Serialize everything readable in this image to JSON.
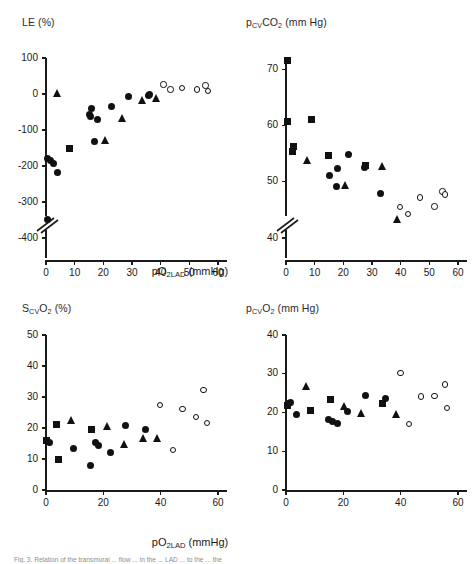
{
  "figure": {
    "width": 476,
    "height": 564,
    "background": "#ffffff",
    "marker_color": "#111111",
    "axis_color": "#1a1a1a",
    "caption_cut_off": "Fig. 3. Relation of the transmural ... flow ... in the ... LAD ... to the ... the"
  },
  "shared": {
    "xlabel_main": "pO",
    "xlabel_sub": "2LAD",
    "xlabel_unit": "(mmHg)",
    "xlabel_full": "pO2LAD (mmHg)"
  },
  "chart_data": [
    {
      "id": "panel-le",
      "type": "scatter",
      "title": "",
      "ylabel": "LE (%)",
      "ylabel_parts": {
        "main": "LE",
        "sub": "",
        "unit": "(%)"
      },
      "xlabel": "pO2LAD (mmHg)",
      "xlim": [
        0,
        60
      ],
      "ylim": [
        -400,
        100
      ],
      "xticks": [
        0,
        10,
        20,
        30,
        40,
        50,
        60
      ],
      "yticks": [
        -400,
        -300,
        -200,
        -100,
        0,
        100
      ],
      "ytick_labels": [
        "-400",
        "-300",
        "-200",
        "-100",
        "0",
        "100"
      ],
      "xtick_labels": [
        "0",
        "10",
        "20",
        "30",
        "40",
        "50",
        "60"
      ],
      "grid": false,
      "legend": "none",
      "y_axis_break": true,
      "series": [
        {
          "name": "filled-circle",
          "marker": "circle-filled",
          "points": [
            [
              0.4,
              -180
            ],
            [
              1.6,
              -185
            ],
            [
              2.6,
              -192
            ],
            [
              4.0,
              -218
            ],
            [
              0.5,
              -348
            ],
            [
              15.2,
              -58
            ],
            [
              15.6,
              -62
            ],
            [
              16.0,
              -40
            ],
            [
              17.8,
              -70
            ],
            [
              17.0,
              -132
            ],
            [
              22.8,
              -36
            ],
            [
              28.8,
              -8
            ],
            [
              35.6,
              -3
            ],
            [
              36.2,
              0
            ]
          ]
        },
        {
          "name": "filled-square",
          "marker": "square-filled",
          "points": [
            [
              8.2,
              -152
            ]
          ]
        },
        {
          "name": "filled-triangle",
          "marker": "triangle-filled",
          "points": [
            [
              4.2,
              0
            ],
            [
              20.8,
              -130
            ],
            [
              26.6,
              -68
            ],
            [
              33.6,
              -18
            ],
            [
              38.6,
              -12
            ]
          ]
        },
        {
          "name": "open-circle",
          "marker": "circle-open",
          "points": [
            [
              41.0,
              26
            ],
            [
              43.4,
              12
            ],
            [
              47.4,
              17
            ],
            [
              52.6,
              13
            ],
            [
              55.6,
              24
            ],
            [
              56.6,
              8
            ]
          ]
        }
      ]
    },
    {
      "id": "panel-pcvco2",
      "type": "scatter",
      "title": "",
      "ylabel": "pCVCO2 (mm Hg)",
      "ylabel_parts": {
        "main": "p",
        "sub": "CV",
        "main2": "CO",
        "sub2": "2",
        "unit": "(mm Hg)"
      },
      "xlabel": "pO2LAD (mmHg)",
      "xlim": [
        0,
        60
      ],
      "ylim": [
        40,
        72
      ],
      "xticks": [
        0,
        10,
        20,
        30,
        40,
        50,
        60
      ],
      "yticks": [
        40,
        50,
        60,
        70
      ],
      "ytick_labels": [
        "40",
        "50",
        "60",
        "70"
      ],
      "xtick_labels": [
        "0",
        "10",
        "20",
        "30",
        "40",
        "50",
        "60"
      ],
      "grid": false,
      "legend": "none",
      "y_axis_break": true,
      "series": [
        {
          "name": "filled-square",
          "marker": "square-filled",
          "points": [
            [
              0.5,
              71.6
            ],
            [
              0.6,
              60.7
            ],
            [
              8.8,
              61.0
            ],
            [
              2.6,
              56.2
            ],
            [
              2.2,
              55.4
            ],
            [
              14.8,
              54.6
            ],
            [
              27.6,
              52.9
            ]
          ]
        },
        {
          "name": "filled-circle",
          "marker": "circle-filled",
          "points": [
            [
              15.2,
              51.2
            ],
            [
              17.8,
              52.3
            ],
            [
              17.6,
              49.2
            ],
            [
              21.8,
              54.8
            ],
            [
              27.4,
              52.6
            ],
            [
              33.0,
              48.0
            ]
          ]
        },
        {
          "name": "filled-triangle",
          "marker": "triangle-filled",
          "points": [
            [
              7.6,
              53.8
            ],
            [
              20.8,
              49.3
            ],
            [
              33.6,
              52.7
            ],
            [
              38.8,
              43.2
            ]
          ]
        },
        {
          "name": "open-circle",
          "marker": "circle-open",
          "points": [
            [
              39.8,
              45.5
            ],
            [
              42.6,
              44.3
            ],
            [
              46.8,
              47.2
            ],
            [
              51.8,
              45.6
            ],
            [
              54.6,
              48.3
            ],
            [
              55.4,
              47.7
            ]
          ]
        }
      ]
    },
    {
      "id": "panel-scvo2",
      "type": "scatter",
      "title": "",
      "ylabel": "SCVO2 (%)",
      "ylabel_parts": {
        "main": "S",
        "sub": "CV",
        "main2": "O",
        "sub2": "2",
        "unit": "(%)"
      },
      "xlabel": "pO2LAD (mmHg)",
      "xlim": [
        0,
        60
      ],
      "ylim": [
        0,
        50
      ],
      "xticks": [
        0,
        20,
        40,
        60
      ],
      "yticks": [
        0,
        10,
        20,
        30,
        40,
        50
      ],
      "ytick_labels": [
        "0",
        "10",
        "20",
        "30",
        "40",
        "50"
      ],
      "xtick_labels": [
        "0",
        "20",
        "40",
        "60"
      ],
      "grid": false,
      "legend": "none",
      "y_axis_break": false,
      "series": [
        {
          "name": "filled-square",
          "marker": "square-filled",
          "points": [
            [
              0.3,
              15.9
            ],
            [
              3.6,
              21.1
            ],
            [
              4.2,
              9.7
            ],
            [
              16.0,
              19.6
            ]
          ]
        },
        {
          "name": "filled-circle",
          "marker": "circle-filled",
          "points": [
            [
              1.2,
              15.3
            ],
            [
              9.6,
              13.5
            ],
            [
              15.6,
              7.9
            ],
            [
              17.4,
              15.4
            ],
            [
              18.2,
              14.4
            ],
            [
              22.6,
              12.1
            ],
            [
              27.6,
              20.9
            ],
            [
              34.6,
              19.6
            ]
          ]
        },
        {
          "name": "filled-triangle",
          "marker": "triangle-filled",
          "points": [
            [
              9.0,
              22.4
            ],
            [
              21.4,
              20.5
            ],
            [
              27.4,
              14.7
            ],
            [
              34.0,
              16.7
            ],
            [
              39.0,
              16.6
            ]
          ]
        },
        {
          "name": "open-circle",
          "marker": "circle-open",
          "points": [
            [
              39.8,
              27.4
            ],
            [
              44.4,
              12.9
            ],
            [
              47.6,
              26.2
            ],
            [
              52.4,
              23.5
            ],
            [
              55.0,
              32.3
            ],
            [
              56.2,
              21.7
            ]
          ]
        }
      ]
    },
    {
      "id": "panel-pcvo2",
      "type": "scatter",
      "title": "",
      "ylabel": "pCVO2 (mm Hg)",
      "ylabel_parts": {
        "main": "p",
        "sub": "CV",
        "main2": "O",
        "sub2": "2",
        "unit": "(mm Hg)"
      },
      "xlabel": "pO2LAD (mmHg)",
      "xlim": [
        0,
        60
      ],
      "ylim": [
        0,
        40
      ],
      "xticks": [
        0,
        20,
        40,
        60
      ],
      "yticks": [
        0,
        10,
        20,
        30,
        40
      ],
      "ytick_labels": [
        "0",
        "10",
        "20",
        "30",
        "40"
      ],
      "xtick_labels": [
        "0",
        "20",
        "40",
        "60"
      ],
      "grid": false,
      "legend": "none",
      "y_axis_break": false,
      "series": [
        {
          "name": "filled-square",
          "marker": "square-filled",
          "points": [
            [
              0.4,
              21.8
            ],
            [
              8.6,
              20.6
            ],
            [
              15.6,
              23.3
            ],
            [
              33.6,
              22.3
            ]
          ]
        },
        {
          "name": "filled-circle",
          "marker": "circle-filled",
          "points": [
            [
              1.0,
              22.4
            ],
            [
              1.4,
              22.6
            ],
            [
              3.6,
              19.5
            ],
            [
              14.8,
              18.1
            ],
            [
              16.2,
              17.8
            ],
            [
              18.0,
              17.1
            ],
            [
              21.4,
              20.2
            ],
            [
              27.6,
              24.4
            ],
            [
              34.6,
              23.5
            ]
          ]
        },
        {
          "name": "filled-triangle",
          "marker": "triangle-filled",
          "points": [
            [
              7.2,
              26.6
            ],
            [
              20.6,
              21.6
            ],
            [
              26.4,
              19.7
            ],
            [
              38.6,
              19.4
            ]
          ]
        },
        {
          "name": "open-circle",
          "marker": "circle-open",
          "points": [
            [
              40.0,
              30.2
            ],
            [
              43.0,
              17.0
            ],
            [
              47.0,
              24.1
            ],
            [
              51.8,
              24.2
            ],
            [
              55.4,
              27.2
            ],
            [
              56.2,
              21.2
            ]
          ]
        }
      ]
    }
  ]
}
